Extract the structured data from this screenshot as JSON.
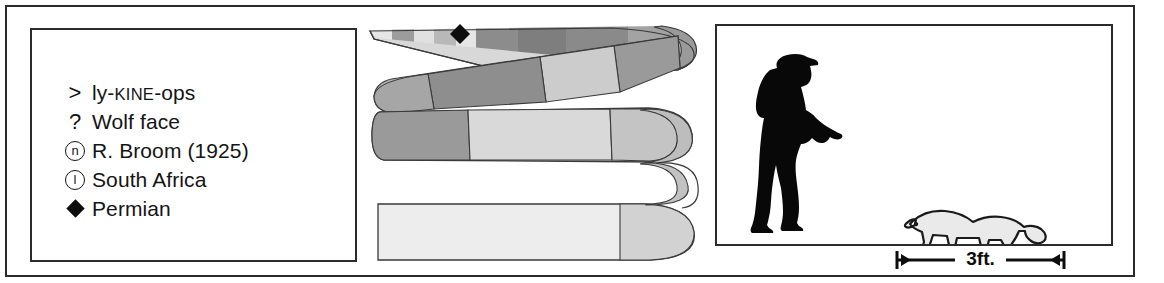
{
  "figure": {
    "background_color": "#ffffff",
    "frame_color": "#2b2b2b"
  },
  "legend": {
    "panel_name": "fact-legend",
    "items": [
      {
        "symbol": "greater-than",
        "symbol_glyph": ">",
        "label": "ly-KINE-ops",
        "label_parts": [
          {
            "text": "ly-",
            "style": "normal"
          },
          {
            "text": "KINE",
            "style": "smallcaps"
          },
          {
            "text": "-ops",
            "style": "normal"
          }
        ],
        "meaning": "pronunciation"
      },
      {
        "symbol": "question-mark",
        "symbol_glyph": "?",
        "label": "Wolf face",
        "meaning": "name-meaning"
      },
      {
        "symbol": "circled-n",
        "symbol_glyph": "n",
        "label": "R. Broom (1925)",
        "meaning": "named-by"
      },
      {
        "symbol": "circled-l",
        "symbol_glyph": "l",
        "label": "South Africa",
        "meaning": "locality"
      },
      {
        "symbol": "filled-diamond",
        "symbol_glyph": "◆",
        "label": "Permian",
        "meaning": "time-period"
      }
    ]
  },
  "timeline": {
    "panel_name": "geologic-time-ribbon",
    "description": "Serpentine folded geologic timescale ribbon",
    "marker": {
      "shape": "filled-diamond",
      "label": "Permian",
      "color": "#0d0d0d"
    },
    "palette": {
      "dark_gray": "#8a8a8a",
      "mid_gray": "#a8a8a8",
      "light_gray": "#c9c9c9",
      "pale_gray": "#e2e2e2",
      "very_pale": "#ededed",
      "outline": "#3a3a3a"
    },
    "bands": [
      {
        "band": "top",
        "segments": [
          "pale",
          "mid",
          "pale",
          "light",
          "mid",
          "dark",
          "dark",
          "mid"
        ]
      },
      {
        "band": "middle",
        "segments": [
          "dark",
          "mid",
          "light",
          "dark"
        ]
      },
      {
        "band": "lower-middle",
        "segments": [
          "dark",
          "light",
          "pale",
          "light"
        ]
      },
      {
        "band": "bottom",
        "segments": [
          "very-pale",
          "light"
        ]
      }
    ]
  },
  "scale": {
    "panel_name": "size-comparison",
    "human": {
      "name": "human-silhouette",
      "description": "Man wearing flat cap, walking",
      "color": "#080808"
    },
    "animal": {
      "name": "lycaenops-silhouette",
      "description": "Gorgonopsian quadruped outline",
      "fill": "#e8e8e8",
      "stroke": "#1a1a1a"
    },
    "bar": {
      "label": "3ft.",
      "name": "scale-bar",
      "endcaps": "arrows"
    }
  }
}
